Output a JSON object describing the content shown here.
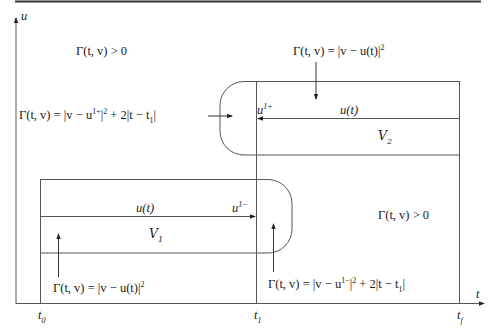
{
  "figure": {
    "axes": {
      "y_label": "u",
      "x_label": "t",
      "x_ticks": [
        {
          "name": "t0",
          "base": "t",
          "sub": "0"
        },
        {
          "name": "t1",
          "base": "t",
          "sub": "1"
        },
        {
          "name": "tf",
          "base": "t",
          "sub": "f"
        }
      ]
    },
    "regions": {
      "v1": {
        "base": "V",
        "sub": "1"
      },
      "v2": {
        "base": "V",
        "sub": "2"
      }
    },
    "curve_labels": {
      "u_t_upper": "u(t)",
      "u_t_lower": "u(t)",
      "u1_plus_base": "u",
      "u1_plus_sup": "1+",
      "u1_minus_base": "u",
      "u1_minus_sup": "1−"
    },
    "annotations": {
      "gamma_positive_top_left": "Γ(t, v) > 0",
      "gamma_positive_bottom_right": "Γ(t, v) > 0",
      "gamma_upper_tracking": {
        "lhs": "Γ(t, v) = |v − u(t)|",
        "sup": "2"
      },
      "gamma_lower_tracking": {
        "lhs": "Γ(t, v) = |v − u(t)|",
        "sup": "2"
      },
      "gamma_upper_cap": {
        "pre": "Γ(t, v) = |v − u",
        "sup1": "1+",
        "mid": "|",
        "sup2": "2",
        "post": " + 2|t − t",
        "sub": "1",
        "end": "|"
      },
      "gamma_lower_cap": {
        "pre": "Γ(t, v) = |v − u",
        "sup1": "1−",
        "mid": "|",
        "sup2": "2",
        "post": " + 2|t − t",
        "sub": "1",
        "end": "|"
      }
    },
    "colors": {
      "line": "#555555",
      "rule": "#333333",
      "text": "#1a1a1a"
    }
  }
}
